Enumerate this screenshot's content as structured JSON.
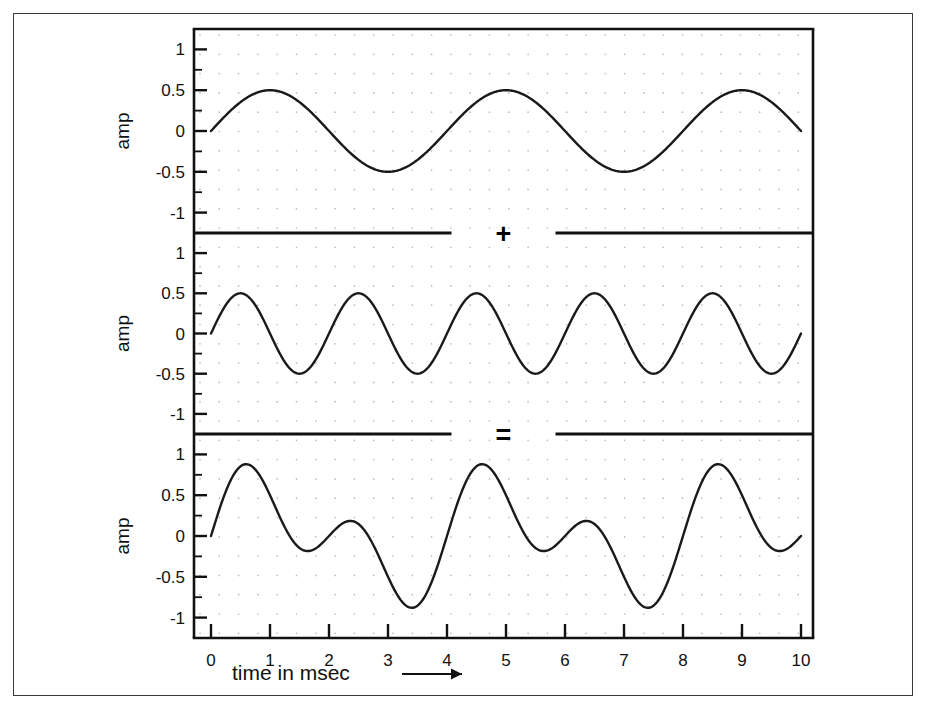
{
  "figure": {
    "xaxis_title": "time in msec",
    "xaxis_arrow": "⟶",
    "operators": [
      {
        "symbol": "+",
        "name": "plus"
      },
      {
        "symbol": "=",
        "name": "equals"
      }
    ]
  },
  "chart_data": [
    {
      "type": "line",
      "name": "panel-top",
      "title": "",
      "xlabel": "time in msec",
      "ylabel": "amp",
      "xlim": [
        0,
        10
      ],
      "ylim": [
        -1.25,
        1.25
      ],
      "xticks": [
        0,
        1,
        2,
        3,
        4,
        5,
        6,
        7,
        8,
        9,
        10
      ],
      "xticklabels": [
        "0",
        "1",
        "2",
        "3",
        "4",
        "5",
        "6",
        "7",
        "8",
        "9",
        "10"
      ],
      "yticks": [
        -1,
        -0.5,
        0,
        0.5,
        1
      ],
      "yticklabels": [
        "-1",
        "-0.5",
        "0",
        "0.5",
        "1"
      ],
      "grid": "dotted",
      "waveform": {
        "kind": "sine",
        "amplitude": 0.5,
        "period_ms": 4,
        "phase_deg": 0,
        "frequency_hz": 250
      },
      "description": "sine wave, amplitude 0.5, period 4 msec, 2.5 cycles across 0-10 msec"
    },
    {
      "type": "line",
      "name": "panel-middle",
      "title": "",
      "xlabel": "time in msec",
      "ylabel": "amp",
      "xlim": [
        0,
        10
      ],
      "ylim": [
        -1.25,
        1.25
      ],
      "xticks": [
        0,
        1,
        2,
        3,
        4,
        5,
        6,
        7,
        8,
        9,
        10
      ],
      "xticklabels": [
        "0",
        "1",
        "2",
        "3",
        "4",
        "5",
        "6",
        "7",
        "8",
        "9",
        "10"
      ],
      "yticks": [
        -1,
        -0.5,
        0,
        0.5,
        1
      ],
      "yticklabels": [
        "-1",
        "-0.5",
        "0",
        "0.5",
        "1"
      ],
      "grid": "dotted",
      "waveform": {
        "kind": "sine",
        "amplitude": 0.5,
        "period_ms": 2,
        "phase_deg": 0,
        "frequency_hz": 500
      },
      "description": "sine wave, amplitude 0.5, period 2 msec, 5 cycles across 0-10 msec"
    },
    {
      "type": "line",
      "name": "panel-bottom",
      "title": "",
      "xlabel": "time in msec",
      "ylabel": "amp",
      "xlim": [
        0,
        10
      ],
      "ylim": [
        -1.25,
        1.25
      ],
      "xticks": [
        0,
        1,
        2,
        3,
        4,
        5,
        6,
        7,
        8,
        9,
        10
      ],
      "xticklabels": [
        "0",
        "1",
        "2",
        "3",
        "4",
        "5",
        "6",
        "7",
        "8",
        "9",
        "10"
      ],
      "yticks": [
        -1,
        -0.5,
        0,
        0.5,
        1
      ],
      "yticklabels": [
        "-1",
        "-0.5",
        "0",
        "0.5",
        "1"
      ],
      "grid": "dotted",
      "waveform": {
        "kind": "sum-of-sines",
        "components": [
          {
            "amplitude": 0.5,
            "period_ms": 4,
            "phase_deg": 0
          },
          {
            "amplitude": 0.5,
            "period_ms": 2,
            "phase_deg": 0
          }
        ]
      },
      "description": "sum of the two sine waves above; peaks near +0.97 at 0.7 ms and troughs near -1.0 at 8.4 ms"
    }
  ],
  "panels": [
    {
      "name": "top",
      "ylabel": "amp",
      "yticklabels": [
        "1",
        "0.5",
        "0",
        "-0.5",
        "-1"
      ]
    },
    {
      "name": "middle",
      "ylabel": "amp",
      "yticklabels": [
        "1",
        "0.5",
        "0",
        "-0.5",
        "-1"
      ]
    },
    {
      "name": "bottom",
      "ylabel": "amp",
      "yticklabels": [
        "1",
        "0.5",
        "0",
        "-0.5",
        "-1"
      ]
    }
  ]
}
